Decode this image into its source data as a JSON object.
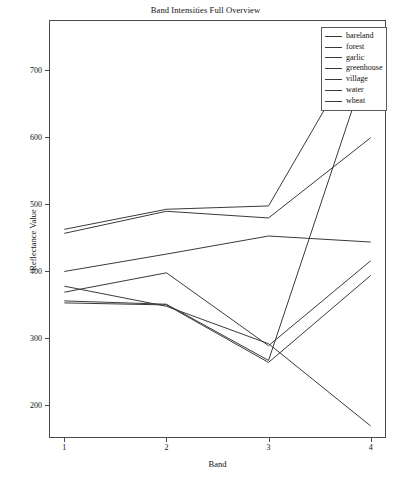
{
  "chart_data": {
    "type": "line",
    "title": "Band Intensities Full Overview",
    "xlabel": "Band",
    "ylabel": "Reflectance Value",
    "x": [
      1,
      2,
      3,
      4
    ],
    "xtick_labels": [
      "1",
      "2",
      "3",
      "4"
    ],
    "ytick_labels": [
      "200",
      "300",
      "400",
      "500",
      "600",
      "700"
    ],
    "ytick_values": [
      200,
      300,
      400,
      500,
      600,
      700
    ],
    "xlim": [
      0.85,
      4.15
    ],
    "ylim": [
      150,
      775
    ],
    "grid": false,
    "legend_position": "upper right",
    "series": [
      {
        "name": "bareland",
        "values": [
          462,
          492,
          497,
          760
        ],
        "color": "#3a3a3a"
      },
      {
        "name": "forest",
        "values": [
          352,
          349,
          263,
          393
        ],
        "color": "#3a3a3a"
      },
      {
        "name": "garlic",
        "values": [
          355,
          350,
          266,
          724
        ],
        "color": "#3a3a3a"
      },
      {
        "name": "greenhouse",
        "values": [
          456,
          489,
          479,
          599
        ],
        "color": "#3a3a3a"
      },
      {
        "name": "village",
        "values": [
          399,
          425,
          452,
          443
        ],
        "color": "#3a3a3a"
      },
      {
        "name": "water",
        "values": [
          377,
          347,
          291,
          168
        ],
        "color": "#3a3a3a"
      },
      {
        "name": "wheat",
        "values": [
          368,
          397,
          288,
          415
        ],
        "color": "#3a3a3a"
      }
    ]
  }
}
